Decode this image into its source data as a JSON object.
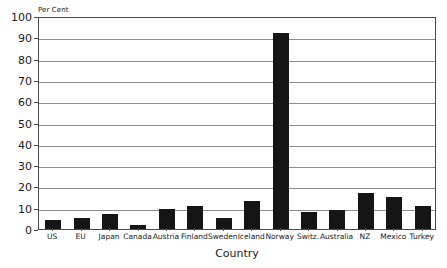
{
  "chart_data": {
    "type": "bar",
    "title": "",
    "ylabel": "Per Cent",
    "xlabel": "Country",
    "ylim": [
      0,
      100
    ],
    "yticks": [
      0,
      10,
      20,
      30,
      40,
      50,
      60,
      70,
      80,
      90,
      100
    ],
    "grid": true,
    "legend": null,
    "bar_color": "#151515",
    "categories": [
      "US",
      "EU",
      "Japan",
      "Canada",
      "Austria",
      "Finland",
      "Sweden",
      "Iceland",
      "Norway",
      "Switz.",
      "Australia",
      "NZ",
      "Mexico",
      "Turkey"
    ],
    "values": [
      4,
      5,
      7,
      2,
      9.5,
      11,
      5,
      13,
      92,
      8,
      9,
      17,
      15,
      11
    ]
  }
}
